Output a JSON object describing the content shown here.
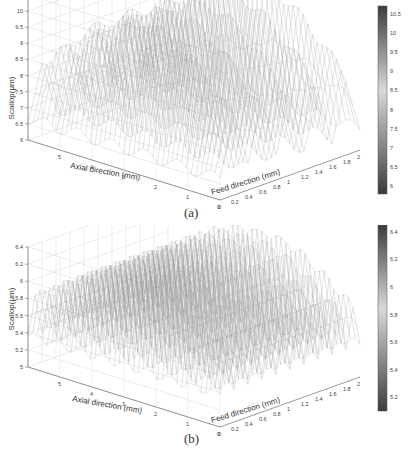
{
  "chart_data": [
    {
      "type": "surface3d",
      "panel": "(a)",
      "title": "",
      "xlabel": "Axial direction (mm)",
      "ylabel": "Feed direction (mm)",
      "zlabel": "Scallop(μm)",
      "x_ticks": [
        "0",
        "1",
        "2",
        "3",
        "4",
        "5"
      ],
      "y_ticks": [
        "0",
        "0.2",
        "0.4",
        "0.6",
        "0.8",
        "1",
        "1.2",
        "1.4",
        "1.6",
        "1.8",
        "2"
      ],
      "z_ticks": [
        "6",
        "6.5",
        "7",
        "7.5",
        "8",
        "8.5",
        "9",
        "9.5",
        "10",
        "10.5"
      ],
      "xlim": [
        0,
        6
      ],
      "ylim": [
        0,
        2
      ],
      "zlim": [
        6,
        10.5
      ],
      "colorbar": {
        "ticks": [
          "6",
          "6.5",
          "7",
          "7.5",
          "8",
          "8.5",
          "9",
          "9.5",
          "10",
          "10.5"
        ],
        "range": [
          5.8,
          10.7
        ],
        "colormap": "grayscale"
      },
      "description": "Mesh surface with ~5 ridges along feed direction; scallop height rising from ~6 µm at edges to peaks near 10.5 µm; sawtooth profile across feed direction",
      "ridge_count_feed": 5,
      "peak_scallop_um": 10.5,
      "min_scallop_um": 6,
      "grid": true
    },
    {
      "type": "surface3d",
      "panel": "(b)",
      "title": "",
      "xlabel": "Axial direction (mm)",
      "ylabel": "Feed direction (mm)",
      "zlabel": "Scallop(μm)",
      "x_ticks": [
        "0",
        "1",
        "2",
        "3",
        "4",
        "5"
      ],
      "y_ticks": [
        "0",
        "0.2",
        "0.4",
        "0.6",
        "0.8",
        "1",
        "1.2",
        "1.4",
        "1.6",
        "1.8",
        "2"
      ],
      "z_ticks": [
        "5",
        "5.2",
        "5.4",
        "5.6",
        "5.8",
        "6",
        "6.2",
        "6.4"
      ],
      "xlim": [
        0,
        6
      ],
      "ylim": [
        0,
        2
      ],
      "zlim": [
        5,
        6.4
      ],
      "colorbar": {
        "ticks": [
          "5.2",
          "5.4",
          "5.6",
          "5.8",
          "6",
          "6.2",
          "6.4"
        ],
        "range": [
          5.1,
          6.45
        ],
        "colormap": "grayscale"
      },
      "description": "Mesh surface with ~10 uniform ridges along feed direction; scallop height ~5.2–6.4 µm with periodic wavy crests",
      "ridge_count_feed": 10,
      "peak_scallop_um": 6.4,
      "min_scallop_um": 5.2,
      "grid": true
    }
  ],
  "panels": {
    "a": {
      "caption": "(a)",
      "zlabel": "Scallop(μm)",
      "xlabel": "Axial direction (mm)",
      "ylabel": "Feed direction (mm)"
    },
    "b": {
      "caption": "(b)",
      "zlabel": "Scallop(μm)",
      "xlabel": "Axial direction (mm)",
      "ylabel": "Feed direction (mm)"
    }
  },
  "colors": {
    "mesh": "#9a9a9a",
    "axis": "#555555",
    "grid": "#d8d8d8",
    "colorbar_dark": "#3c3c3c",
    "colorbar_light": "#d9d9d9"
  }
}
